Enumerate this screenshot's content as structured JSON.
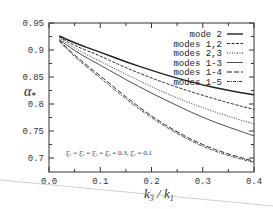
{
  "chart_data": {
    "type": "line",
    "title": "",
    "xlabel": "k3 / k1",
    "ylabel": "α*",
    "xlim": [
      0.0,
      0.4
    ],
    "ylim": [
      0.68,
      0.95
    ],
    "xticks": [
      "0.0",
      "0.1",
      "0.2",
      "0.3",
      "0.4"
    ],
    "yticks": [
      "0.7",
      "0.75",
      "0.8",
      "0.85",
      "0.9",
      "0.95"
    ],
    "grid": false,
    "legend_position": "upper right",
    "x": [
      0.02,
      0.05,
      0.1,
      0.15,
      0.2,
      0.25,
      0.3,
      0.35,
      0.4
    ],
    "series": [
      {
        "name": "mode 2",
        "style": "solid-thick",
        "values": [
          0.926,
          0.913,
          0.896,
          0.878,
          0.862,
          0.848,
          0.835,
          0.825,
          0.817
        ]
      },
      {
        "name": "modes 1,2",
        "style": "dashed",
        "values": [
          0.924,
          0.908,
          0.889,
          0.867,
          0.848,
          0.831,
          0.816,
          0.802,
          0.79
        ]
      },
      {
        "name": "modes 2,3",
        "style": "dotted",
        "values": [
          0.922,
          0.903,
          0.879,
          0.855,
          0.832,
          0.811,
          0.793,
          0.777,
          0.763
        ]
      },
      {
        "name": "modes 1-3",
        "style": "solid-thin",
        "values": [
          0.92,
          0.898,
          0.872,
          0.845,
          0.82,
          0.797,
          0.775,
          0.757,
          0.741
        ]
      },
      {
        "name": "modes 1-4",
        "style": "dash-long",
        "values": [
          0.918,
          0.89,
          0.852,
          0.813,
          0.777,
          0.748,
          0.724,
          0.707,
          0.694
        ]
      },
      {
        "name": "modes 1-5",
        "style": "dash-dot",
        "values": [
          0.916,
          0.887,
          0.848,
          0.809,
          0.774,
          0.745,
          0.721,
          0.704,
          0.692
        ]
      }
    ],
    "annotations": [
      "ξ̄1 = ξ̄3 = ξ̄4 = ξ̄5 = 0.3,  ξ̄2 = 0.1"
    ]
  },
  "axes": {
    "ylabel_main": "α",
    "ylabel_sub": "*",
    "xlabel_num": "k",
    "xlabel_num_sub": "3",
    "xlabel_den": "k",
    "xlabel_den_sub": "1"
  },
  "legend": [
    {
      "label": "mode 2"
    },
    {
      "label": "modes 1,2"
    },
    {
      "label": "modes 2,3"
    },
    {
      "label": "modes 1-3"
    },
    {
      "label": "modes 1-4"
    },
    {
      "label": "modes 1-5"
    }
  ],
  "annotation": {
    "text": "ξ̄₁ = ξ̄₃ = ξ̄₄ = ξ̄₅ = 0.3,  ξ̄₂ = 0.1"
  },
  "colors": {
    "line": "#222222",
    "frame": "#333333"
  }
}
